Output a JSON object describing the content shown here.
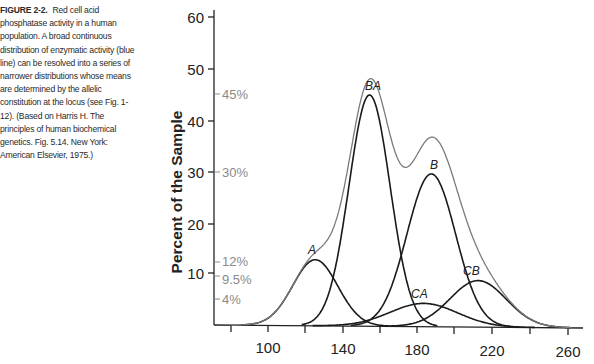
{
  "caption": {
    "figure_label": "FIGURE 2-2.",
    "text": "Red cell acid phosphatase activity in a human population. A broad continuous distribution of enzymatic activity (blue line) can be resolved into a series of narrower distributions whose means are determined by the allelic constitution at the locus (see Fig. 1-12). (Based on Harris H. The principles of human biochemical genetics. Fig. 5.14. New York: American Elsevier, 1975.)"
  },
  "chart_data": {
    "type": "line",
    "title": "",
    "xlabel": "",
    "ylabel": "Percent of the Sample",
    "xlim": [
      75,
      270
    ],
    "ylim": [
      0,
      62
    ],
    "x_ticks": [
      80,
      100,
      120,
      140,
      160,
      180,
      200,
      220,
      240,
      260
    ],
    "x_tick_labels": [
      "100",
      "140",
      "180",
      "220",
      "260"
    ],
    "y_ticks": [
      10,
      20,
      30,
      40,
      50,
      60
    ],
    "y_tick_labels": [
      "10",
      "20",
      "30",
      "40",
      "50",
      "60"
    ],
    "grid": false,
    "percent_markers": [
      {
        "label": "45%",
        "y": 45
      },
      {
        "label": "30%",
        "y": 30
      },
      {
        "label": "12%",
        "y": 12.5
      },
      {
        "label": "9.5%",
        "y": 9.5
      },
      {
        "label": "4%",
        "y": 4.5
      }
    ],
    "series": [
      {
        "name": "Total (envelope)",
        "color": "#7a7a7a",
        "peak_x": 160,
        "peak_y": 60.7
      },
      {
        "name": "A",
        "color": "#1a1a1a",
        "peak_x": 125,
        "peak_y": 12.8,
        "sd": 12
      },
      {
        "name": "BA",
        "color": "#1a1a1a",
        "peak_x": 154,
        "peak_y": 44.8,
        "sd": 11
      },
      {
        "name": "B",
        "color": "#1a1a1a",
        "peak_x": 187,
        "peak_y": 29.6,
        "sd": 13
      },
      {
        "name": "CA",
        "color": "#1a1a1a",
        "peak_x": 183,
        "peak_y": 4.5,
        "sd": 18
      },
      {
        "name": "CB",
        "color": "#1a1a1a",
        "peak_x": 212,
        "peak_y": 9.0,
        "sd": 15
      }
    ]
  },
  "labels": {
    "ylabel": "Percent of the Sample",
    "curves": {
      "A": "A",
      "BA": "BA",
      "B": "B",
      "CA": "CA",
      "CB": "CB"
    },
    "pct": {
      "p45": "45%",
      "p30": "30%",
      "p12": "12%",
      "p95": "9.5%",
      "p4": "4%"
    },
    "yticks": {
      "t10": "10",
      "t20": "20",
      "t30": "30",
      "t40": "40",
      "t50": "50",
      "t60": "60"
    },
    "xticks": {
      "t100": "100",
      "t140": "140",
      "t180": "180",
      "t220": "220",
      "t260": "260"
    }
  }
}
